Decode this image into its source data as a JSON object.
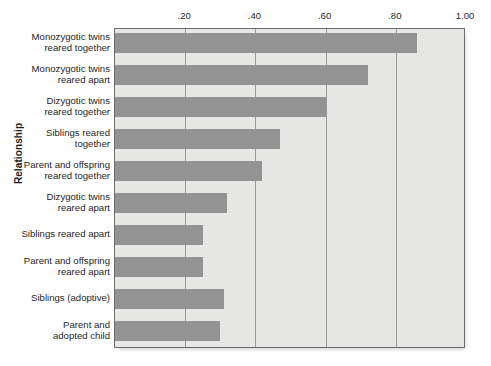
{
  "chart_data": {
    "type": "bar",
    "orientation": "horizontal",
    "title": "",
    "xlabel": "",
    "ylabel": "Relationship",
    "xlim": [
      0,
      1.0
    ],
    "xticks": [
      0.2,
      0.4,
      0.6,
      0.8,
      1.0
    ],
    "xtick_labels": [
      ".20",
      ".40",
      ".60",
      ".80",
      "1.00"
    ],
    "grid": true,
    "legend": "none",
    "bar_color": "#939393",
    "plot_background": "#e6e7e4",
    "categories": [
      "Monozygotic twins reared together",
      "Monozygotic twins reared apart",
      "Dizygotic twins reared together",
      "Siblings reared together",
      "Parent and offspring reared together",
      "Dizygotic twins reared apart",
      "Siblings reared apart",
      "Parent and offspring reared apart",
      "Siblings (adoptive)",
      "Parent and adopted child"
    ],
    "category_lines": [
      [
        "Monozygotic twins",
        "reared together"
      ],
      [
        "Monozygotic twins",
        "reared apart"
      ],
      [
        "Dizygotic twins",
        "reared together"
      ],
      [
        "Siblings reared",
        "together"
      ],
      [
        "Parent and offspring",
        "reared together"
      ],
      [
        "Dizygotic twins",
        "reared apart"
      ],
      [
        "Siblings reared apart"
      ],
      [
        "Parent and offspring",
        "reared apart"
      ],
      [
        "Siblings (adoptive)"
      ],
      [
        "Parent and",
        "adopted child"
      ]
    ],
    "values": [
      0.86,
      0.72,
      0.6,
      0.47,
      0.42,
      0.32,
      0.25,
      0.25,
      0.31,
      0.3
    ]
  }
}
